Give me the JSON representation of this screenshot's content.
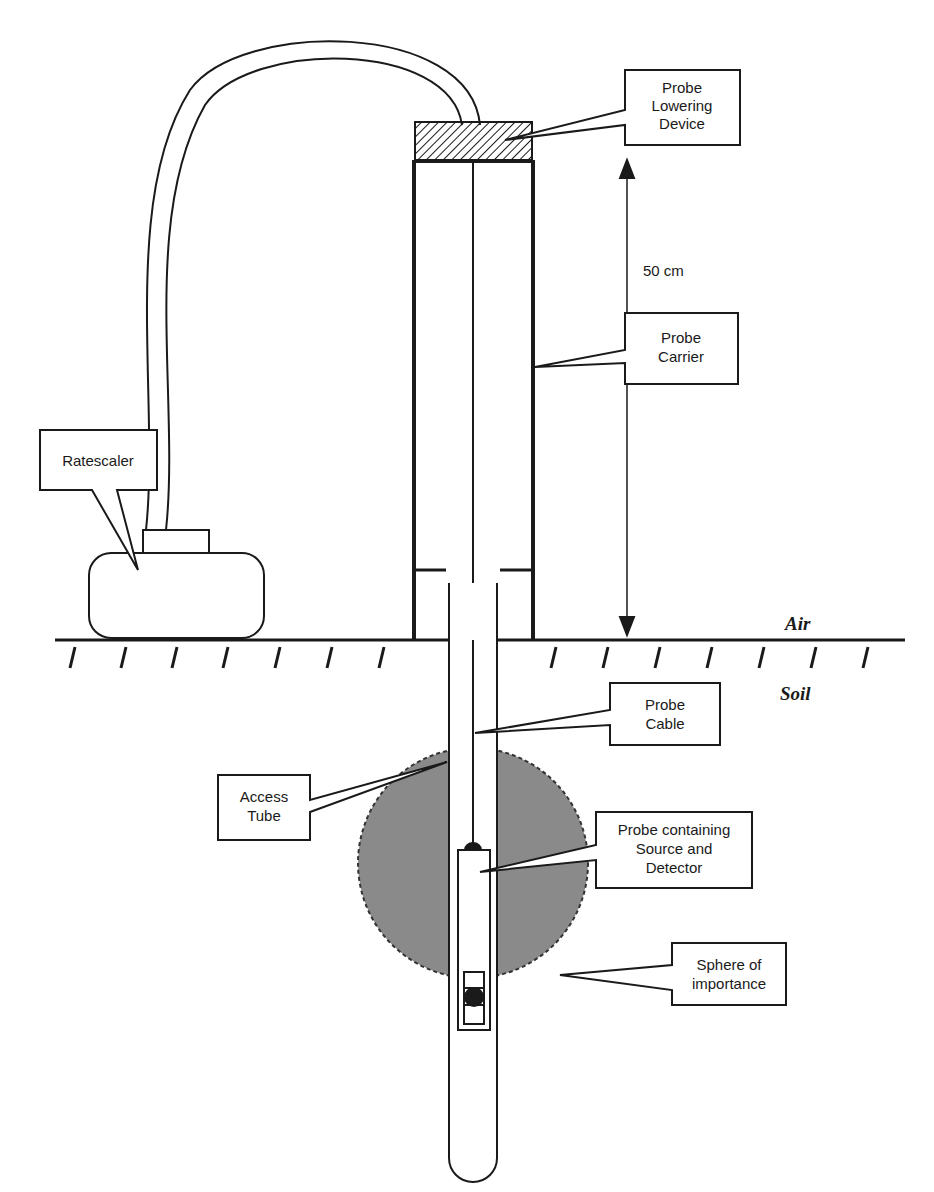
{
  "diagram": {
    "labels": {
      "probe_lowering_device": [
        "Probe",
        "Lowering",
        "Device"
      ],
      "probe_carrier": [
        "Probe",
        "Carrier"
      ],
      "ratescaler": [
        "Ratescaler"
      ],
      "probe_cable": [
        "Probe",
        "Cable"
      ],
      "access_tube": [
        "Access",
        "Tube"
      ],
      "probe_source_detector": [
        "Probe containing",
        "Source and",
        "Detector"
      ],
      "sphere": [
        "Sphere of",
        "importance"
      ]
    },
    "dimension": "50 cm",
    "air": "Air",
    "soil": "Soil"
  }
}
